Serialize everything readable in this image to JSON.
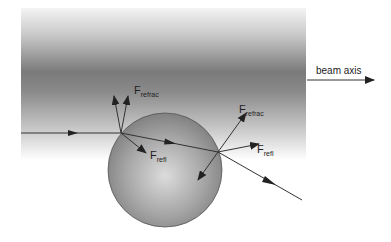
{
  "figure": {
    "type": "diagram",
    "colors": {
      "background": "#ffffff",
      "beam_dark": "#6e6e6e",
      "beam_light": "#f2f2f2",
      "sphere_light": "#d4d4d4",
      "sphere_dark": "#7a7a7a",
      "line": "#333333"
    }
  },
  "labels": {
    "beam_axis": "beam axis",
    "f_refrac_left": {
      "main": "F",
      "sub": "refrac"
    },
    "f_refl_left": {
      "main": "F",
      "sub": "refl"
    },
    "f_refrac_right": {
      "main": "F",
      "sub": "refrac"
    },
    "f_refl_right": {
      "main": "F",
      "sub": "refl"
    }
  },
  "elements": {
    "beam": {
      "x": 21,
      "y": 8,
      "width": 285,
      "height": 150
    },
    "sphere": {
      "cx": 165,
      "cy": 170,
      "r": 57
    },
    "rays": [
      {
        "name": "incoming-ray",
        "from": [
          21,
          133
        ],
        "to": [
          121,
          133
        ],
        "arrow_at": [
          76,
          133
        ]
      },
      {
        "name": "internal-ray",
        "from": [
          121,
          133
        ],
        "to": [
          218,
          152
        ],
        "arrow_at": [
          172,
          143
        ]
      },
      {
        "name": "outgoing-ray",
        "from": [
          218,
          152
        ],
        "to": [
          302,
          200
        ],
        "arrow_at": [
          272,
          183
        ]
      }
    ],
    "forces": [
      {
        "name": "f-refrac-left-a",
        "from": [
          121,
          133
        ],
        "to": [
          114,
          96
        ]
      },
      {
        "name": "f-refrac-left-b",
        "from": [
          121,
          133
        ],
        "to": [
          128,
          96
        ]
      },
      {
        "name": "f-refl-left",
        "from": [
          121,
          133
        ],
        "to": [
          146,
          153
        ]
      },
      {
        "name": "f-refrac-right",
        "from": [
          218,
          152
        ],
        "to": [
          246,
          113
        ]
      },
      {
        "name": "f-refl-right",
        "from": [
          218,
          152
        ],
        "to": [
          259,
          144
        ]
      },
      {
        "name": "f-inward-right",
        "from": [
          218,
          152
        ],
        "to": [
          198,
          180
        ]
      }
    ],
    "beam_axis_arrow": {
      "from": [
        307,
        80
      ],
      "to": [
        374,
        80
      ]
    }
  }
}
